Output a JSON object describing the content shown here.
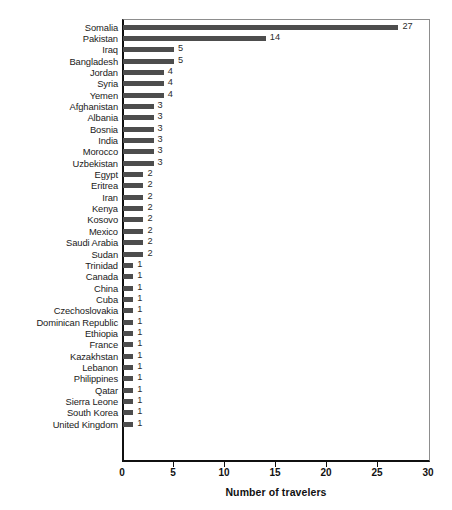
{
  "chart_data": {
    "type": "bar",
    "orientation": "horizontal",
    "title": "",
    "subtitle": "",
    "xlabel": "Number of travelers",
    "ylabel": "",
    "xlim": [
      0,
      30
    ],
    "xticks": [
      0,
      5,
      10,
      15,
      20,
      25,
      30
    ],
    "xtick_labels": [
      "0",
      "5",
      "10",
      "15",
      "20",
      "25",
      "30"
    ],
    "grid": false,
    "legend": null,
    "bar_color": "#4d4d4d",
    "axis_color": "#101010",
    "frame_color": "#8d8d8d",
    "show_value_labels": true,
    "categories": [
      "Somalia",
      "Pakistan",
      "Iraq",
      "Bangladesh",
      "Jordan",
      "Syria",
      "Yemen",
      "Afghanistan",
      "Albania",
      "Bosnia",
      "India",
      "Morocco",
      "Uzbekistan",
      "Egypt",
      "Eritrea",
      "Iran",
      "Kenya",
      "Kosovo",
      "Mexico",
      "Saudi Arabia",
      "Sudan",
      "Trinidad",
      "Canada",
      "China",
      "Cuba",
      "Czechoslovakia",
      "Dominican Republic",
      "Ethiopia",
      "France",
      "Kazakhstan",
      "Lebanon",
      "Philippines",
      "Qatar",
      "Sierra Leone",
      "South Korea",
      "United Kingdom"
    ],
    "values": [
      27,
      14,
      5,
      5,
      4,
      4,
      4,
      3,
      3,
      3,
      3,
      3,
      3,
      2,
      2,
      2,
      2,
      2,
      2,
      2,
      2,
      1,
      1,
      1,
      1,
      1,
      1,
      1,
      1,
      1,
      1,
      1,
      1,
      1,
      1,
      1
    ],
    "value_labels": [
      "27",
      "14",
      "5",
      "5",
      "4",
      "4",
      "4",
      "3",
      "3",
      "3",
      "3",
      "3",
      "3",
      "2",
      "2",
      "2",
      "2",
      "2",
      "2",
      "2",
      "2",
      "1",
      "1",
      "1",
      "1",
      "1",
      "1",
      "1",
      "1",
      "1",
      "1",
      "1",
      "1",
      "1",
      "1",
      "1"
    ]
  }
}
